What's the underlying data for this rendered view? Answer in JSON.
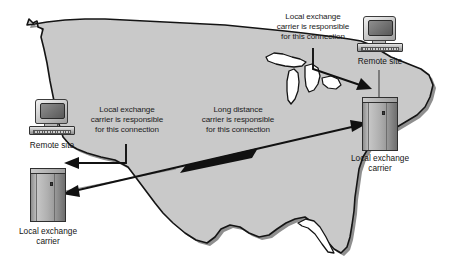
{
  "diagram": {
    "background_map": "united-states-outline",
    "colors": {
      "map_fill": "#c9c9c9",
      "map_outline": "#1a1a1a",
      "map_shadow": "#8a8a8a",
      "text": "#1b1b1b",
      "arrow": "#111111",
      "page_background": "#ffffff"
    }
  },
  "annotations": [
    {
      "id": "left-local-exchange-note",
      "line1": "Local exchange",
      "line2": "carrier is responsible",
      "line3": "for this connection"
    },
    {
      "id": "center-long-distance-note",
      "line1": "Long distance",
      "line2": "carrier is responsible",
      "line3": "for this connection"
    },
    {
      "id": "top-right-local-exchange-note",
      "line1": "Local exchange",
      "line2": "carrier is responsible",
      "line3": "for this connection"
    }
  ],
  "nodes": [
    {
      "id": "left-remote-site",
      "type": "computer",
      "label": "Remote  site"
    },
    {
      "id": "left-local-exchange-carrier",
      "type": "server",
      "label_line1": "Local exchange",
      "label_line2": "carrier"
    },
    {
      "id": "right-remote-site",
      "type": "computer",
      "label": "Remote  site"
    },
    {
      "id": "right-local-exchange-carrier",
      "type": "server",
      "label_line1": "Local exchange",
      "label_line2": "carrier"
    }
  ],
  "connections": [
    {
      "id": "left-local-loop",
      "from": "left-remote-site",
      "to": "left-local-exchange-carrier",
      "style": "leader-with-arrowhead"
    },
    {
      "id": "long-distance-link",
      "from": "left-local-exchange-carrier",
      "to": "right-local-exchange-carrier",
      "style": "double-headed-arrow"
    },
    {
      "id": "right-local-loop",
      "from": "right-remote-site",
      "to": "right-local-exchange-carrier",
      "style": "leader-with-arrowhead"
    }
  ]
}
